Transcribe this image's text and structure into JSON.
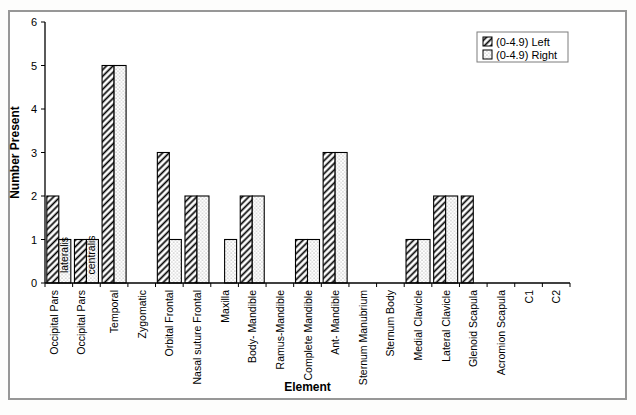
{
  "figure": {
    "background": "#ffffff",
    "frame_border_color": "#979797",
    "axis_color": "#000000"
  },
  "chart_data": {
    "type": "bar",
    "title": "",
    "xlabel": "Element",
    "ylabel": "Number Present",
    "ylim": [
      0,
      6
    ],
    "yticks": [
      0,
      1,
      2,
      3,
      4,
      5,
      6
    ],
    "grid": false,
    "legend_position": "top-right",
    "bar_outline_color": "#000000",
    "bar_fill_background": "#ffffff",
    "categories": [
      "Occipital Pars\nlateralis",
      "Occipital Pars\ncentralis",
      "Temporal",
      "Zygomatic",
      "Orbital Frontal",
      "Nasal suture Frontal",
      "Maxilla",
      "Body- Mandible",
      "Ramus-Mandible",
      "Complete Mandible",
      "Ant- Mandible",
      "Sternum Manubrium",
      "Sternum Body",
      "Medial Clavicle",
      "Lateral Clavicle",
      "Glenoid Scapula",
      "Acromion Scapula",
      "C1",
      "C2"
    ],
    "series": [
      {
        "name": "(0-4.9) Left",
        "pattern": "diagonal-hatch",
        "values": [
          2,
          1,
          5,
          0,
          3,
          2,
          0,
          2,
          0,
          1,
          3,
          0,
          0,
          1,
          2,
          2,
          0,
          0,
          0
        ]
      },
      {
        "name": "(0-4.9) Right",
        "pattern": "dot-stipple",
        "values": [
          1,
          1,
          5,
          0,
          1,
          2,
          1,
          2,
          0,
          1,
          3,
          0,
          0,
          1,
          2,
          0,
          0,
          0,
          0
        ]
      }
    ]
  }
}
